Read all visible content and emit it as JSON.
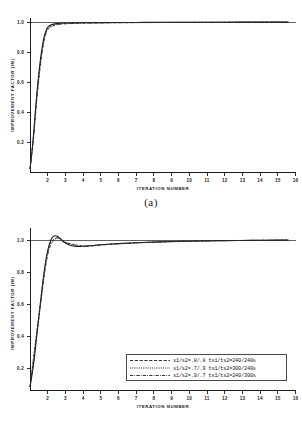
{
  "figure": {
    "caption_a": "(a)",
    "caption_b": "(b)"
  },
  "chart_data": [
    {
      "id": "panel-a",
      "type": "line",
      "title": "",
      "caption": "(a)",
      "xlabel": "ITERATION NUMBER",
      "ylabel": "IMPROVEMENT FACTOR (IM)",
      "xlim": [
        1,
        16
      ],
      "ylim": [
        0,
        1.05
      ],
      "xticks": [
        2,
        3,
        4,
        5,
        6,
        7,
        8,
        9,
        10,
        11,
        12,
        13,
        14,
        15,
        16
      ],
      "xticklabels": [
        "2",
        "3",
        "4",
        "5",
        "6",
        "7",
        "8",
        "9",
        "10",
        "11",
        "12",
        "13",
        "14",
        "15",
        "16"
      ],
      "yticks": [
        0.2,
        0.4,
        0.6,
        0.8,
        1.0
      ],
      "yticklabels": [
        "0.2",
        "0.4",
        "0.6",
        "0.8",
        "1.0"
      ],
      "grid": false,
      "legend_position": "none",
      "reference_line": 1.0,
      "series": [
        {
          "name": "s1/s2=.8/.8 ts1/ts2=240/240s",
          "style": "solid",
          "x": [
            1.0,
            1.1,
            1.2,
            1.3,
            1.4,
            1.5,
            1.6,
            1.7,
            1.8,
            1.9,
            2.0,
            2.2,
            2.5,
            3.0,
            4.0,
            5.0,
            6.0,
            7.0,
            8.0,
            9.0,
            10.0,
            11.0,
            12.0,
            13.0,
            14.0,
            15.0,
            15.6
          ],
          "values": [
            0.02,
            0.12,
            0.25,
            0.4,
            0.54,
            0.66,
            0.76,
            0.84,
            0.9,
            0.94,
            0.965,
            0.981,
            0.989,
            0.993,
            0.995,
            0.996,
            0.9965,
            0.997,
            0.9975,
            0.998,
            0.9982,
            0.9985,
            0.9987,
            0.9989,
            0.999,
            0.9992,
            0.9993
          ]
        },
        {
          "name": "s1/s2=.7/.9 ts1/ts2=300/240s",
          "style": "dashed",
          "x": [
            1.0,
            1.2,
            1.4,
            1.6,
            1.8,
            2.0,
            2.3,
            2.6,
            3.0,
            4.0,
            5.0,
            6.0,
            7.0,
            8.0,
            9.0,
            10.0,
            11.0,
            12.0,
            13.0,
            14.0,
            15.0,
            15.6
          ],
          "values": [
            0.02,
            0.24,
            0.52,
            0.74,
            0.89,
            0.955,
            0.978,
            0.986,
            0.99,
            0.9935,
            0.9948,
            0.9957,
            0.9963,
            0.9969,
            0.9974,
            0.9978,
            0.9981,
            0.9984,
            0.9986,
            0.9988,
            0.999,
            0.9991
          ]
        },
        {
          "name": "s1/s2=.9/.7 ts1/ts2=240/300s",
          "style": "dashdot",
          "x": [
            1.0,
            1.2,
            1.4,
            1.6,
            1.8,
            2.0,
            2.3,
            2.6,
            3.0,
            4.0,
            5.0,
            6.0,
            7.0,
            8.0,
            9.0,
            10.0,
            11.0,
            12.0,
            13.0,
            14.0,
            15.0,
            15.6
          ],
          "values": [
            0.02,
            0.23,
            0.5,
            0.72,
            0.875,
            0.948,
            0.974,
            0.983,
            0.988,
            0.992,
            0.9938,
            0.9949,
            0.9957,
            0.9964,
            0.997,
            0.9975,
            0.9979,
            0.9982,
            0.9985,
            0.9987,
            0.9989,
            0.999
          ]
        }
      ]
    },
    {
      "id": "panel-b",
      "type": "line",
      "title": "",
      "caption": "(b)",
      "xlabel": "ITERATION NUMBER",
      "ylabel": "IMPROVEMENT FACTOR (IM)",
      "xlim": [
        1,
        16
      ],
      "ylim": [
        0,
        1.05
      ],
      "xticks": [
        2,
        3,
        4,
        5,
        6,
        7,
        8,
        9,
        10,
        11,
        12,
        13,
        14,
        15,
        16
      ],
      "xticklabels": [
        "2",
        "3",
        "4",
        "5",
        "6",
        "7",
        "8",
        "9",
        "10",
        "11",
        "12",
        "13",
        "14",
        "15",
        "16"
      ],
      "yticks": [
        0.2,
        0.4,
        0.6,
        0.8,
        1.0
      ],
      "yticklabels": [
        "0.2",
        "0.4",
        "0.6",
        "0.8",
        "1.0"
      ],
      "grid": false,
      "legend_position": "lower-right",
      "reference_line": 1.0,
      "series": [
        {
          "name": "s1/s2=.8/.8 ts1/ts2=240/240s",
          "style": "solid",
          "x": [
            1.0,
            1.2,
            1.4,
            1.6,
            1.8,
            2.0,
            2.2,
            2.4,
            2.6,
            2.8,
            3.0,
            3.3,
            3.6,
            4.0,
            4.5,
            5.0,
            6.0,
            7.0,
            8.0,
            9.0,
            10.0,
            11.0,
            12.0,
            13.0,
            14.0,
            15.0,
            15.6
          ],
          "values": [
            0.02,
            0.17,
            0.38,
            0.59,
            0.79,
            0.93,
            1.005,
            1.028,
            1.02,
            1.0,
            0.98,
            0.963,
            0.957,
            0.958,
            0.963,
            0.968,
            0.976,
            0.982,
            0.986,
            0.99,
            0.992,
            0.994,
            0.996,
            0.997,
            0.998,
            0.999,
            0.9993
          ]
        },
        {
          "name": "s1/s2=.7/.9 ts1/ts2=300/240s",
          "style": "dashed",
          "x": [
            1.0,
            1.5,
            2.0,
            2.5,
            3.0,
            4.0,
            5.0,
            6.0,
            8.0,
            10.0,
            12.0,
            14.0,
            15.6
          ],
          "values": [
            0.02,
            0.5,
            0.92,
            1.015,
            0.985,
            0.96,
            0.968,
            0.976,
            0.986,
            0.992,
            0.996,
            0.998,
            0.9993
          ]
        },
        {
          "name": "s1/s2=.9/.7 ts1/ts2=240/300s",
          "style": "dashdot",
          "x": [
            1.0,
            1.5,
            2.0,
            2.5,
            3.0,
            4.0,
            5.0,
            6.0,
            8.0,
            10.0,
            12.0,
            14.0,
            15.6
          ],
          "values": [
            0.02,
            0.48,
            0.9,
            1.01,
            0.982,
            0.958,
            0.966,
            0.975,
            0.985,
            0.991,
            0.9955,
            0.9978,
            0.9992
          ]
        }
      ],
      "legend": [
        {
          "label": "s1/s2=.8/.8 ts1/ts2=240/240s",
          "style": "dashed"
        },
        {
          "label": "s1/s2=.7/.9 ts1/ts2=300/240s",
          "style": "dotted"
        },
        {
          "label": "s1/s2=.9/.7 ts1/ts2=240/300s",
          "style": "dashdot"
        }
      ]
    }
  ]
}
